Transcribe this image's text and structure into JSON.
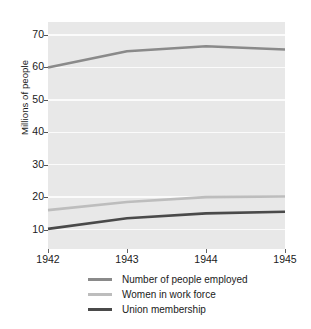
{
  "chart_data": {
    "type": "line",
    "title": "",
    "xlabel": "",
    "ylabel": "Millions of people",
    "categories": [
      "1942",
      "1943",
      "1944",
      "1945"
    ],
    "x": [
      1942,
      1943,
      1944,
      1945
    ],
    "xlim": [
      1942,
      1945
    ],
    "ylim": [
      4,
      74
    ],
    "yticks": [
      10,
      20,
      30,
      40,
      50,
      60,
      70
    ],
    "ytick_labels": [
      "10",
      "20",
      "30",
      "40",
      "50",
      "60",
      "70"
    ],
    "xtick_labels": [
      "1942",
      "1943",
      "1944",
      "1945"
    ],
    "grid": true,
    "grid_color": "#fbfbfb",
    "plot_background": "#e8e8e8",
    "legend_position": "below",
    "series": [
      {
        "name": "Number of people employed",
        "values": [
          60.0,
          65.0,
          66.5,
          65.5
        ],
        "color": "#8a8a8a"
      },
      {
        "name": "Women in work force",
        "values": [
          16.0,
          18.5,
          20.0,
          20.2
        ],
        "color": "#bdbdbd"
      },
      {
        "name": "Union membership",
        "values": [
          10.2,
          13.5,
          15.0,
          15.5
        ],
        "color": "#4a4a4a"
      }
    ]
  },
  "axes": {
    "y_title": "Millions of people"
  },
  "legend": {
    "items": [
      {
        "label": "Number of people employed",
        "color": "#8a8a8a"
      },
      {
        "label": "Women in work force",
        "color": "#bdbdbd"
      },
      {
        "label": "Union membership",
        "color": "#4a4a4a"
      }
    ]
  }
}
